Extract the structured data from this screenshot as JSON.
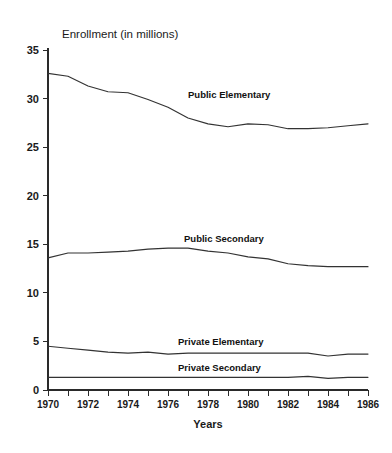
{
  "chart_data": {
    "type": "line",
    "title": "Enrollment (in millions)",
    "xlabel": "Years",
    "ylabel": "",
    "xlim": [
      1970,
      1986
    ],
    "ylim": [
      0,
      35
    ],
    "ytick_interval": 5,
    "xtick_interval_minor": 1,
    "xtick_interval_major": 2,
    "grid": false,
    "legend": "inline-labels",
    "x": [
      1970,
      1971,
      1972,
      1973,
      1974,
      1975,
      1976,
      1977,
      1978,
      1979,
      1980,
      1981,
      1982,
      1983,
      1984,
      1985,
      1986
    ],
    "yticks": [
      0,
      5,
      10,
      15,
      20,
      25,
      30,
      35
    ],
    "ytick_labels": [
      "0",
      "5",
      "10",
      "15",
      "20",
      "25",
      "30",
      "35"
    ],
    "xticks_labeled": [
      1970,
      1972,
      1974,
      1976,
      1978,
      1980,
      1982,
      1984,
      1986
    ],
    "xtick_labels": [
      "1970",
      "1972",
      "1974",
      "1976",
      "1978",
      "1980",
      "1982",
      "1984",
      "1986"
    ],
    "series": [
      {
        "name": "Public Elementary",
        "label_x": 1977.0,
        "label_y": 30.1,
        "values": [
          32.6,
          32.3,
          31.3,
          30.7,
          30.6,
          29.9,
          29.1,
          28.0,
          27.4,
          27.1,
          27.4,
          27.3,
          26.9,
          26.9,
          27.0,
          27.2,
          27.4
        ]
      },
      {
        "name": "Public Secondary",
        "label_x": 1976.8,
        "label_y": 15.2,
        "values": [
          13.6,
          14.1,
          14.1,
          14.2,
          14.3,
          14.5,
          14.6,
          14.6,
          14.3,
          14.1,
          13.7,
          13.5,
          13.0,
          12.8,
          12.7,
          12.7,
          12.7
        ]
      },
      {
        "name": "Private Elementary",
        "label_x": 1976.5,
        "label_y": 4.6,
        "values": [
          4.5,
          4.3,
          4.1,
          3.9,
          3.8,
          3.9,
          3.7,
          3.8,
          3.8,
          3.8,
          3.8,
          3.8,
          3.8,
          3.8,
          3.5,
          3.7,
          3.7
        ]
      },
      {
        "name": "Private Secondary",
        "label_x": 1976.5,
        "label_y": 2.0,
        "values": [
          1.3,
          1.3,
          1.3,
          1.3,
          1.3,
          1.3,
          1.3,
          1.3,
          1.3,
          1.3,
          1.3,
          1.3,
          1.3,
          1.4,
          1.2,
          1.3,
          1.3
        ]
      }
    ]
  }
}
